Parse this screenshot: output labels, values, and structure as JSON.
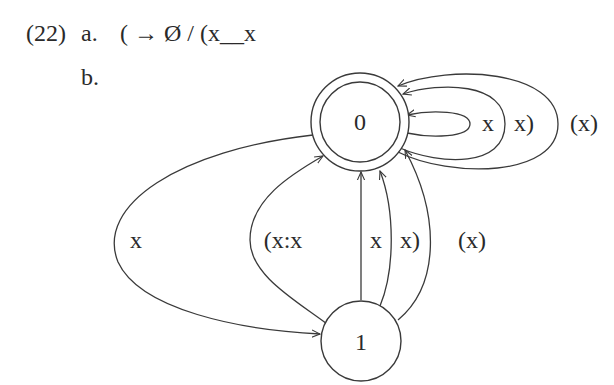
{
  "example": {
    "number": "(22)",
    "a": {
      "label": "a.",
      "rule": "( → Ø / (x__x"
    },
    "b": {
      "label": "b."
    }
  },
  "diagram": {
    "type": "finite-state-automaton",
    "nodes": [
      {
        "id": "0",
        "label": "0",
        "accepting": true
      },
      {
        "id": "1",
        "label": "1",
        "accepting": false
      }
    ],
    "edges": [
      {
        "from": "0",
        "to": "0",
        "label": "x"
      },
      {
        "from": "0",
        "to": "0",
        "label": "x)"
      },
      {
        "from": "0",
        "to": "0",
        "label": "(x)"
      },
      {
        "from": "0",
        "to": "1",
        "label": "x"
      },
      {
        "from": "1",
        "to": "0",
        "label": "(x:x"
      },
      {
        "from": "1",
        "to": "0",
        "label": "x"
      },
      {
        "from": "1",
        "to": "0",
        "label": "x)"
      },
      {
        "from": "1",
        "to": "0",
        "label": "(x)"
      }
    ]
  }
}
